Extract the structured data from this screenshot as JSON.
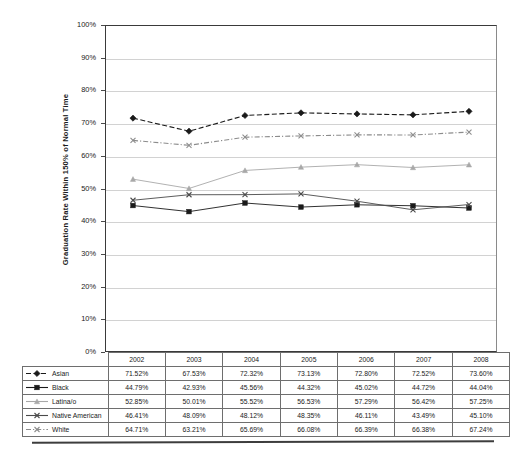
{
  "chart_data": {
    "type": "line",
    "title": "",
    "xlabel": "",
    "ylabel": "Graduation Rate Within 150% of Normal Time",
    "ylim": [
      0,
      100
    ],
    "ytick_labels": [
      "100%",
      "90%",
      "80%",
      "70%",
      "60%",
      "50%",
      "40%",
      "30%",
      "20%",
      "10%",
      "0%"
    ],
    "ytick_values": [
      100,
      90,
      80,
      70,
      60,
      50,
      40,
      30,
      20,
      10,
      0
    ],
    "grid": "horizontal",
    "legend_position": "table-left-column",
    "categories": [
      "2002",
      "2003",
      "2004",
      "2005",
      "2006",
      "2007",
      "2008"
    ],
    "series": [
      {
        "name": "Asian",
        "marker": "diamond",
        "linestyle": "dashed",
        "color": "#1a1a1a",
        "values": [
          71.52,
          67.53,
          72.32,
          73.13,
          72.8,
          72.52,
          73.6
        ],
        "labels": [
          "71.52%",
          "67.53%",
          "72.32%",
          "73.13%",
          "72.80%",
          "72.52%",
          "73.60%"
        ]
      },
      {
        "name": "Black",
        "marker": "square",
        "linestyle": "solid",
        "color": "#1a1a1a",
        "values": [
          44.79,
          42.93,
          45.56,
          44.32,
          45.02,
          44.72,
          44.04
        ],
        "labels": [
          "44.79%",
          "42.93%",
          "45.56%",
          "44.32%",
          "45.02%",
          "44.72%",
          "44.04%"
        ]
      },
      {
        "name": "Latina/o",
        "marker": "triangle",
        "linestyle": "solid",
        "color": "#a8a8a8",
        "values": [
          52.85,
          50.01,
          55.52,
          56.53,
          57.29,
          56.42,
          57.25
        ],
        "labels": [
          "52.85%",
          "50.01%",
          "55.52%",
          "56.53%",
          "57.29%",
          "56.42%",
          "57.25%"
        ]
      },
      {
        "name": "Native American",
        "marker": "cross",
        "linestyle": "solid",
        "color": "#4a4a4a",
        "values": [
          46.41,
          48.09,
          48.12,
          48.35,
          46.11,
          43.49,
          45.1
        ],
        "labels": [
          "46.41%",
          "48.09%",
          "48.12%",
          "48.35%",
          "46.11%",
          "43.49%",
          "45.10%"
        ]
      },
      {
        "name": "White",
        "marker": "cross",
        "linestyle": "dashdot",
        "color": "#8c8c8c",
        "values": [
          64.71,
          63.21,
          65.69,
          66.08,
          66.39,
          66.38,
          67.24
        ],
        "labels": [
          "64.71%",
          "63.21%",
          "65.69%",
          "66.08%",
          "66.39%",
          "66.38%",
          "67.24%"
        ]
      }
    ]
  }
}
